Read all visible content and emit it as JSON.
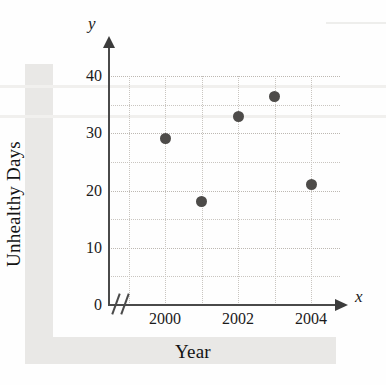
{
  "chart_data": {
    "type": "scatter",
    "title": "",
    "xlabel": "Year",
    "ylabel": "Unhealthy Days",
    "x_axis_variable": "x",
    "y_axis_variable": "y",
    "xlim": [
      1999,
      2005
    ],
    "ylim": [
      0,
      42
    ],
    "x_tick_labels": [
      "2000",
      "2002",
      "2004"
    ],
    "x_tick_values": [
      2000,
      2002,
      2004
    ],
    "y_tick_labels": [
      "0",
      "10",
      "20",
      "30",
      "40"
    ],
    "y_tick_values": [
      0,
      10,
      20,
      30,
      40
    ],
    "y_minor_tick_values": [
      5,
      15,
      25,
      35
    ],
    "x_gridline_values": [
      1999,
      2000,
      2001,
      2002,
      2003,
      2004
    ],
    "grid": true,
    "legend": false,
    "axis_break": true,
    "marker_color": "#4d4b49",
    "axis_color": "#4a4a4a",
    "grid_color": "#c9c5c0",
    "points": [
      {
        "x": 2000,
        "y": 29,
        "label": "2000"
      },
      {
        "x": 2001,
        "y": 18,
        "label": "2001"
      },
      {
        "x": 2002,
        "y": 33,
        "label": "2002"
      },
      {
        "x": 2003,
        "y": 36.5,
        "label": "2003"
      },
      {
        "x": 2004,
        "y": 21,
        "label": "2004"
      }
    ],
    "x": [
      2000,
      2001,
      2002,
      2003,
      2004
    ],
    "values": [
      29,
      18,
      33,
      36.5,
      21
    ]
  },
  "axis_titles": {
    "y": "Unhealthy Days",
    "x": "Year"
  },
  "axis_variables": {
    "y": "y",
    "x": "x"
  },
  "y_ticks": [
    {
      "label": "40",
      "value": 40
    },
    {
      "label": "30",
      "value": 30
    },
    {
      "label": "20",
      "value": 20
    },
    {
      "label": "10",
      "value": 10
    },
    {
      "label": "0",
      "value": 0
    }
  ],
  "x_ticks": [
    {
      "label": "2000",
      "value": 2000
    },
    {
      "label": "2002",
      "value": 2002
    },
    {
      "label": "2004",
      "value": 2004
    }
  ]
}
